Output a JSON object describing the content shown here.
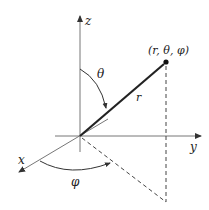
{
  "diagram": {
    "axes": {
      "x_label": "x",
      "y_label": "y",
      "z_label": "z"
    },
    "point_label": "(r, θ, φ)",
    "radius_label": "r",
    "polar_angle_label": "θ",
    "azimuth_angle_label": "φ",
    "colors": {
      "line": "#333333",
      "thin_line": "#777777",
      "dashed": "#444444"
    }
  }
}
